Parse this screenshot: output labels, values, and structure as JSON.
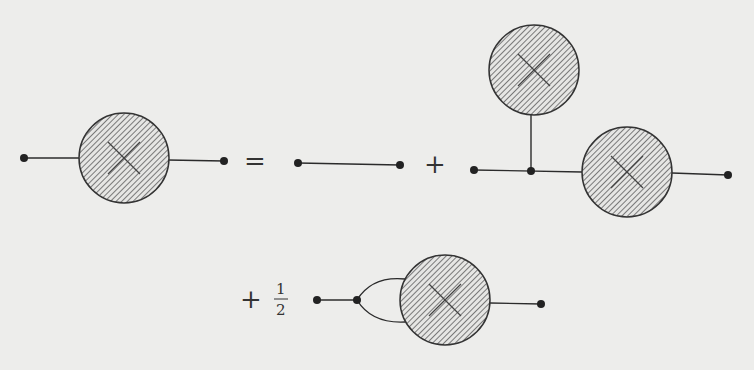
{
  "diagram": {
    "type": "feynman-diagram-equation",
    "colors": {
      "background": "#ededeb",
      "ink": "#2b2b2b",
      "hatch": "#555555"
    },
    "operators": {
      "equals": "=",
      "plus_1": "+",
      "plus_2": "+",
      "fraction_numerator": "1",
      "fraction_denominator": "2"
    },
    "terms": [
      {
        "id": "lhs",
        "label": "dressed propagator",
        "blobs": 1
      },
      {
        "id": "rhs-1",
        "label": "bare propagator",
        "blobs": 0
      },
      {
        "id": "rhs-2",
        "label": "tadpole term",
        "blobs": 2
      },
      {
        "id": "rhs-3",
        "label": "loop term",
        "blobs": 1,
        "coefficient": "1/2"
      }
    ]
  }
}
